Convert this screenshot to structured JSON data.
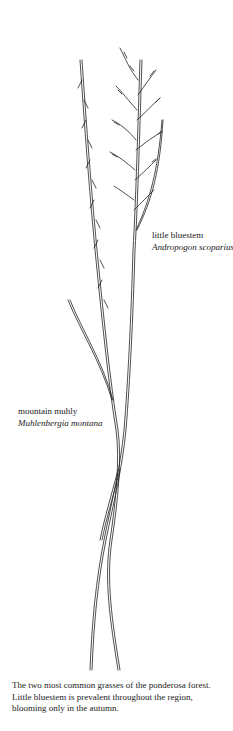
{
  "figure": {
    "type": "botanical-line-drawing",
    "labels": [
      {
        "common_name": "little bluestem",
        "scientific_name": "Andropogon scoparius"
      },
      {
        "common_name": "mountain muhly",
        "scientific_name": "Muhlenbergia montana"
      }
    ]
  },
  "caption": "The two most common grasses of the ponderosa forest. Little bluestem is prevalent throughout the region, blooming only in the autumn."
}
